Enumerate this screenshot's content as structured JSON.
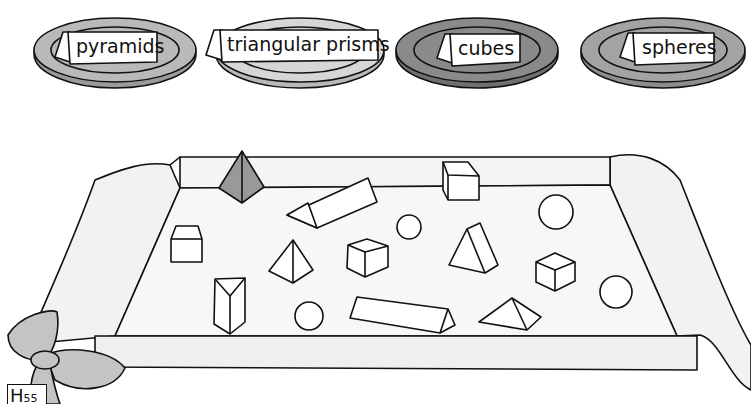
{
  "worksheet": {
    "plates": [
      {
        "label": "pyramids",
        "fill": "#b9b9b9"
      },
      {
        "label": "triangular prisms",
        "fill": "#d6d6d6"
      },
      {
        "label": "cubes",
        "fill": "#8a8a8a"
      },
      {
        "label": "spheres",
        "fill": "#a3a3a3"
      }
    ],
    "page_tag": {
      "letter": "H",
      "number": "55"
    },
    "tray": {
      "shapes": [
        {
          "type": "pyramid",
          "shaded": true
        },
        {
          "type": "triangular-prism"
        },
        {
          "type": "cube"
        },
        {
          "type": "cube"
        },
        {
          "type": "sphere"
        },
        {
          "type": "sphere"
        },
        {
          "type": "pyramid"
        },
        {
          "type": "cube"
        },
        {
          "type": "triangular-prism"
        },
        {
          "type": "cube"
        },
        {
          "type": "triangular-prism"
        },
        {
          "type": "sphere"
        },
        {
          "type": "triangular-prism"
        },
        {
          "type": "pyramid"
        },
        {
          "type": "sphere"
        }
      ]
    }
  }
}
